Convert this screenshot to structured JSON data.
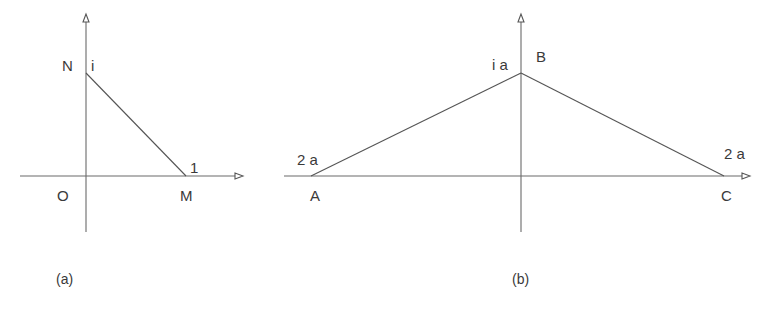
{
  "figure": {
    "panel_a": {
      "caption": "(a)",
      "origin_label": "O",
      "points": {
        "N": {
          "label": "N",
          "value_label": "i"
        },
        "M": {
          "label": "M",
          "value_label": "1"
        }
      }
    },
    "panel_b": {
      "caption": "(b)",
      "points": {
        "A": {
          "label": "A",
          "value_label": "2 a"
        },
        "B": {
          "label": "B",
          "value_label": "i a"
        },
        "C": {
          "label": "C",
          "value_label": "2 a"
        }
      }
    }
  }
}
